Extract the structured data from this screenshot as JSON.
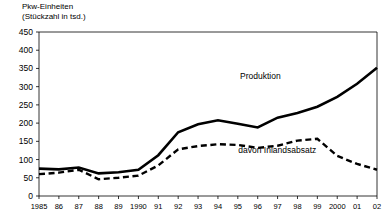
{
  "chart_data": {
    "type": "line",
    "title": "Pkw-Einheiten\n(Stückzahl in tsd.)",
    "title_line1": "Pkw-Einheiten",
    "title_line2": "(Stückzahl in tsd.)",
    "xlabel": "",
    "ylabel": "Pkw-Einheiten (Stückzahl in tsd.)",
    "ylim": [
      0,
      450
    ],
    "ytick_step": 50,
    "yticks": [
      0,
      50,
      100,
      150,
      200,
      250,
      300,
      350,
      400,
      450
    ],
    "ytick_labels": [
      "0",
      "50",
      "100",
      "150",
      "200",
      "250",
      "300",
      "350",
      "400",
      "450"
    ],
    "grid": false,
    "legend": "inline-annotations",
    "x": [
      1985,
      1986,
      1987,
      1988,
      1989,
      1990,
      1991,
      1992,
      1993,
      1994,
      1995,
      1996,
      1997,
      1998,
      1999,
      2000,
      2001,
      2002
    ],
    "categories": [
      "1985",
      "86",
      "87",
      "88",
      "89",
      "1990",
      "91",
      "92",
      "93",
      "94",
      "95",
      "96",
      "97",
      "98",
      "99",
      "2000",
      "01",
      "02"
    ],
    "series": [
      {
        "name": "Produktion",
        "style": "solid",
        "color": "#000000",
        "values": [
          75,
          73,
          78,
          62,
          65,
          72,
          112,
          175,
          197,
          208,
          198,
          188,
          215,
          228,
          245,
          272,
          308,
          352
        ]
      },
      {
        "name": "davon Inlandsabsatz",
        "style": "dashed",
        "color": "#000000",
        "values": [
          60,
          64,
          72,
          46,
          50,
          56,
          84,
          128,
          137,
          142,
          140,
          132,
          138,
          152,
          157,
          110,
          88,
          72
        ]
      }
    ],
    "annotations": [
      {
        "text": "Produktion",
        "x_frac": 0.655,
        "y_value": 320
      },
      {
        "text": "davon Inlandsabsatz",
        "x_frac": 0.705,
        "y_value": 118
      }
    ]
  }
}
